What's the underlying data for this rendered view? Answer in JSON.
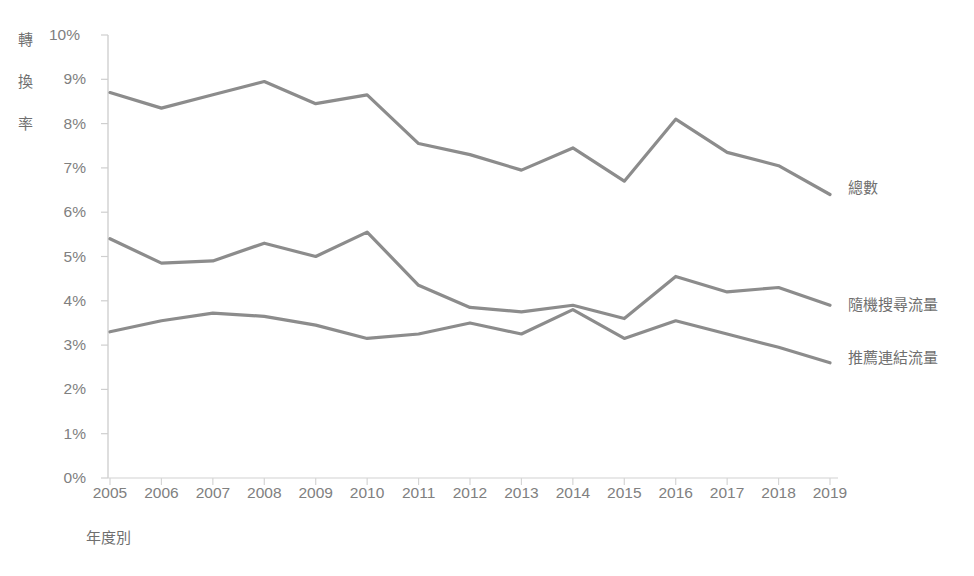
{
  "chart_data": {
    "type": "line",
    "title": "",
    "xlabel": "年度別",
    "ylabel": "轉換率",
    "ylabel_chars": [
      "轉",
      "換",
      "率"
    ],
    "categories": [
      "2005",
      "2006",
      "2007",
      "2008",
      "2009",
      "2010",
      "2011",
      "2012",
      "2013",
      "2014",
      "2015",
      "2016",
      "2017",
      "2018",
      "2019"
    ],
    "x": [
      2005,
      2006,
      2007,
      2008,
      2009,
      2010,
      2011,
      2012,
      2013,
      2014,
      2015,
      2016,
      2017,
      2018,
      2019
    ],
    "ylim": [
      0,
      10
    ],
    "y_unit": "%",
    "y_ticks": [
      "0%",
      "1%",
      "2%",
      "3%",
      "4%",
      "5%",
      "6%",
      "7%",
      "8%",
      "9%",
      "10%"
    ],
    "y_tick_values": [
      0,
      1,
      2,
      3,
      4,
      5,
      6,
      7,
      8,
      9,
      10
    ],
    "grid": false,
    "legend_position": "right-inline",
    "series": [
      {
        "name": "總數",
        "color": "#8c8c8c",
        "values": [
          8.7,
          8.35,
          8.65,
          8.95,
          8.45,
          8.65,
          7.55,
          7.3,
          6.95,
          7.45,
          6.7,
          8.1,
          7.35,
          7.05,
          6.4
        ],
        "label_y_value": 6.6
      },
      {
        "name": "隨機搜尋流量",
        "color": "#8c8c8c",
        "values": [
          5.4,
          4.85,
          4.9,
          5.3,
          5.0,
          5.55,
          4.35,
          3.85,
          3.75,
          3.9,
          3.6,
          4.55,
          4.2,
          4.3,
          3.9
        ],
        "label_y_value": 3.95
      },
      {
        "name": "推薦連結流量",
        "color": "#8c8c8c",
        "values": [
          3.3,
          3.55,
          3.72,
          3.65,
          3.45,
          3.15,
          3.25,
          3.5,
          3.25,
          3.8,
          3.15,
          3.55,
          3.25,
          2.95,
          2.6
        ],
        "label_y_value": 2.75
      }
    ]
  },
  "axis": {
    "y_axis_name": "y-axis",
    "x_axis_name": "x-axis"
  }
}
